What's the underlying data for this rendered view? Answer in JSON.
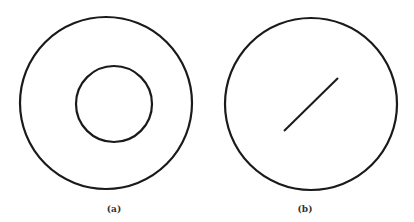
{
  "figure": {
    "panels": [
      {
        "label": "(a)",
        "outer_circle": {
          "cx": 106,
          "cy": 103,
          "r": 86
        },
        "inner_circle": {
          "cx": 114,
          "cy": 104,
          "r": 38
        }
      },
      {
        "label": "(b)",
        "outer_circle": {
          "cx": 311,
          "cy": 104,
          "r": 86
        },
        "segment": {
          "x1": 284,
          "y1": 131,
          "x2": 338,
          "y2": 78
        }
      }
    ],
    "colors": {
      "stroke": "#1a1a1a",
      "background": "#ffffff",
      "label": "#333333"
    }
  }
}
